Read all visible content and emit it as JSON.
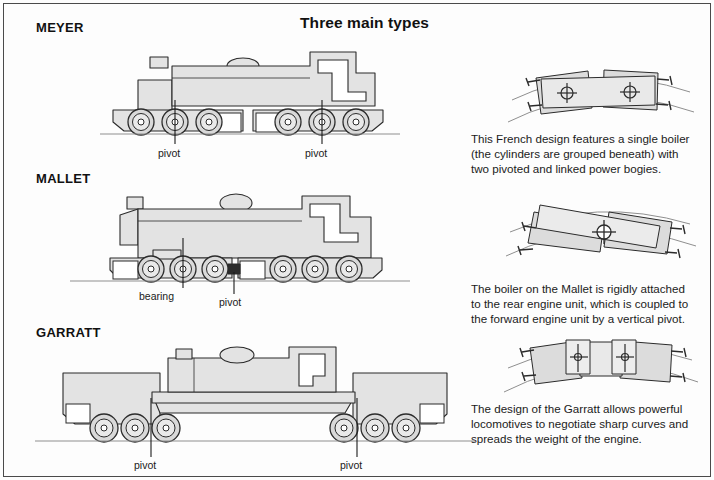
{
  "title": "Three main types",
  "types": [
    {
      "id": "meyer",
      "label": "MEYER"
    },
    {
      "id": "mallet",
      "label": "MALLET"
    },
    {
      "id": "garratt",
      "label": "GARRATT"
    }
  ],
  "captions": {
    "meyer": "This French design features a single boiler (the cylinders are grouped beneath) with two pivoted and linked power bogies.",
    "mallet": "The boiler on the Mallet is rigidly attached to the rear engine unit, which is coupled to the forward engine unit by a vertical pivot.",
    "garratt": "The design of the Garratt allows powerful locomotives to negotiate sharp curves and spreads the weight of the engine."
  },
  "annotations": {
    "pivot": "pivot",
    "bearing": "bearing"
  },
  "meyer_callouts": [
    {
      "text": "pivot",
      "x": 155,
      "y": 148
    },
    {
      "text": "pivot",
      "x": 310,
      "y": 148
    }
  ],
  "mallet_callouts": [
    {
      "text": "bearing",
      "x": 139,
      "y": 291
    },
    {
      "text": "pivot",
      "x": 223,
      "y": 297
    }
  ],
  "garratt_callouts": [
    {
      "text": "pivot",
      "x": 134,
      "y": 461
    },
    {
      "text": "pivot",
      "x": 340,
      "y": 461
    }
  ],
  "colors": {
    "body_fill": "#e3e3e3",
    "body_fill_light": "#ececec",
    "outline": "#2b2b2b",
    "wheel_fill": "#d9d9d9",
    "rail": "#8f8f8f",
    "text": "#1b1b1b",
    "frame": "#4a4a4a",
    "white": "#ffffff"
  },
  "plan_views": [
    {
      "id": "meyer-plan",
      "description": "rigid frame on curve with two pivoted bogies"
    },
    {
      "id": "mallet-plan",
      "description": "two engine units hinged at a single central vertical pivot"
    },
    {
      "id": "garratt-plan",
      "description": "central boiler cradle between two pivoted engine units on curve"
    }
  ]
}
